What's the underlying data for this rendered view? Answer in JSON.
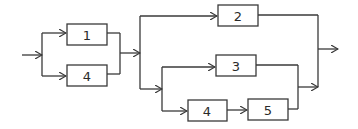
{
  "diagram": {
    "type": "reliability block diagram",
    "blocks": [
      {
        "id": "b1",
        "label": "1"
      },
      {
        "id": "b4a",
        "label": "4"
      },
      {
        "id": "b2",
        "label": "2"
      },
      {
        "id": "b3",
        "label": "3"
      },
      {
        "id": "b4b",
        "label": "4"
      },
      {
        "id": "b5",
        "label": "5"
      }
    ],
    "colors": {
      "line": "#3a3a3a",
      "background": "#ffffff"
    }
  }
}
